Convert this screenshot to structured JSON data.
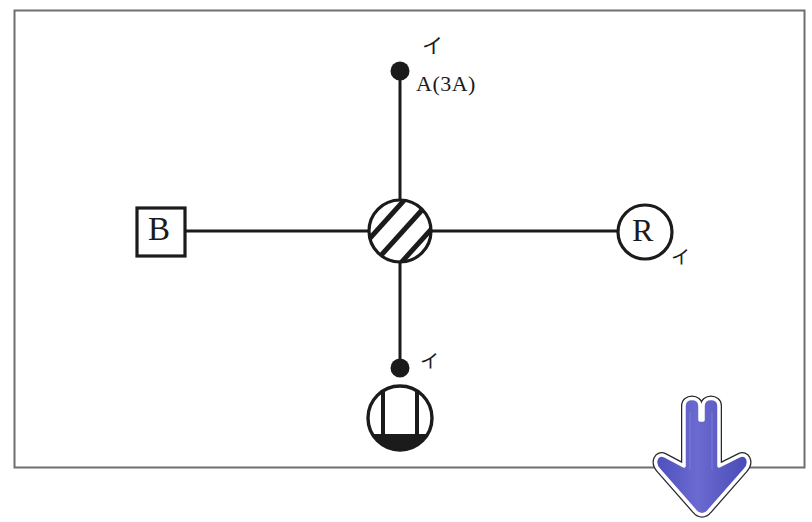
{
  "canvas": {
    "width": 812,
    "height": 522,
    "background": "#ffffff"
  },
  "frame": {
    "name": "outer-border",
    "x": 14,
    "y": 10,
    "width": 791,
    "height": 458,
    "stroke": "#6e6e72"
  },
  "diagram": {
    "line_color": "#1b1b1b",
    "nodes": {
      "center_valve": {
        "label": "",
        "shape": "hatched-circle",
        "cx": 400,
        "cy": 231,
        "r": 32
      },
      "left_box": {
        "label": "B",
        "shape": "square",
        "x": 136,
        "y": 207,
        "size": 50
      },
      "right_circle": {
        "label": "R",
        "shape": "circle",
        "cx": 645,
        "cy": 232,
        "r": 28
      },
      "top_terminal": {
        "label": "A(3A)",
        "shape": "filled-dot",
        "cx": 400,
        "cy": 71,
        "r": 9
      },
      "bottom_terminal": {
        "label": "",
        "shape": "filled-dot",
        "cx": 400,
        "cy": 368,
        "r": 9
      },
      "bottom_gauge": {
        "label": "",
        "shape": "half-filled-circle-with-bars",
        "cx": 400,
        "cy": 418,
        "r": 33
      }
    },
    "annotations": {
      "top_code": "A(3A)",
      "kana_top": "イ",
      "kana_right": "イ",
      "kana_bottom": "イ",
      "box_letter": "B",
      "circle_letter": "R"
    }
  },
  "pointer": {
    "name": "down-arrow-annotation",
    "direction": "down",
    "fill": "#5a5ac4",
    "fill_light": "#7b7bd8",
    "outline": "#ffffff",
    "border": "#26262e",
    "x": 668,
    "y": 394,
    "width": 80,
    "height": 120
  }
}
